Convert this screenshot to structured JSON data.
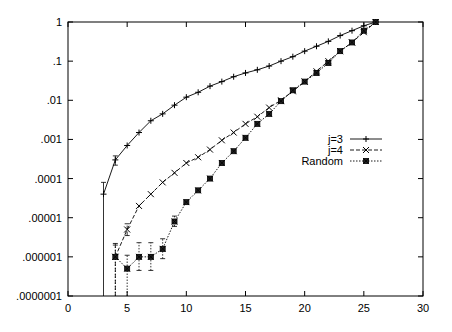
{
  "chart_data": {
    "type": "line",
    "title": "",
    "xlabel": "",
    "ylabel": "",
    "xscale": "linear",
    "yscale": "log",
    "xlim": [
      0,
      30
    ],
    "ylim": [
      1e-07,
      1
    ],
    "grid": false,
    "legend_position": "right-middle inside",
    "x_ticks": [
      0,
      5,
      10,
      15,
      20,
      25,
      30
    ],
    "x_tick_labels": [
      "0",
      "5",
      "10",
      "15",
      "20",
      "25",
      "30"
    ],
    "y_ticks": [
      1,
      0.1,
      0.01,
      0.001,
      0.0001,
      1e-05,
      1e-06,
      1e-07
    ],
    "y_tick_labels": [
      "1",
      ".1",
      ".01",
      ".001",
      ".0001",
      ".00001",
      ".000001",
      ".0000001"
    ],
    "series": [
      {
        "name": "j=3",
        "style": "solid",
        "marker": "plus",
        "x": [
          3,
          4,
          5,
          6,
          7,
          8,
          9,
          10,
          11,
          12,
          13,
          14,
          15,
          16,
          17,
          18,
          19,
          20,
          21,
          22,
          23,
          24,
          25,
          26
        ],
        "values": [
          4e-05,
          0.0003,
          0.0007,
          0.0015,
          0.003,
          0.0045,
          0.0075,
          0.012,
          0.016,
          0.023,
          0.03,
          0.04,
          0.05,
          0.06,
          0.075,
          0.1,
          0.13,
          0.18,
          0.24,
          0.32,
          0.45,
          0.6,
          0.8,
          1
        ],
        "error_low": [
          1e-07,
          0.00022,
          null,
          null,
          null,
          null,
          null,
          null,
          null,
          null,
          null,
          null,
          null,
          null,
          null,
          null,
          null,
          null,
          null,
          null,
          null,
          null,
          null,
          null
        ],
        "error_high": [
          8e-05,
          0.00038,
          null,
          null,
          null,
          null,
          null,
          null,
          null,
          null,
          null,
          null,
          null,
          null,
          null,
          null,
          null,
          null,
          null,
          null,
          null,
          null,
          null,
          null
        ]
      },
      {
        "name": "j=4",
        "style": "dashed",
        "marker": "cross",
        "x": [
          4,
          5,
          6,
          7,
          8,
          9,
          10,
          11,
          12,
          13,
          14,
          15,
          16,
          17,
          18,
          19,
          20,
          21,
          22,
          23,
          24,
          25,
          26
        ],
        "values": [
          1e-06,
          5e-06,
          2e-05,
          4e-05,
          8e-05,
          0.00014,
          0.00025,
          0.00035,
          0.00055,
          0.00095,
          0.0015,
          0.0025,
          0.0038,
          0.0065,
          0.01,
          0.017,
          0.03,
          0.055,
          0.1,
          0.18,
          0.3,
          0.55,
          1
        ],
        "error_low": [
          1e-07,
          3.5e-06,
          null,
          null,
          null,
          null,
          null,
          null,
          null,
          null,
          null,
          null,
          null,
          null,
          null,
          null,
          null,
          null,
          null,
          null,
          null,
          null,
          null
        ],
        "error_high": [
          2e-06,
          7e-06,
          null,
          null,
          null,
          null,
          null,
          null,
          null,
          null,
          null,
          null,
          null,
          null,
          null,
          null,
          null,
          null,
          null,
          null,
          null,
          null,
          null
        ]
      },
      {
        "name": "Random",
        "style": "dotted",
        "marker": "boxed-star",
        "x": [
          4,
          5,
          6,
          7,
          8,
          9,
          10,
          11,
          12,
          13,
          14,
          15,
          16,
          17,
          18,
          19,
          20,
          21,
          22,
          23,
          24,
          25,
          26
        ],
        "values": [
          1e-06,
          5e-07,
          1e-06,
          1e-06,
          1.6e-06,
          8e-06,
          2.5e-05,
          5e-05,
          0.0001,
          0.00025,
          0.0005,
          0.0011,
          0.0025,
          0.0045,
          0.0095,
          0.018,
          0.03,
          0.05,
          0.09,
          0.18,
          0.3,
          0.6,
          1
        ],
        "error_low": [
          1e-07,
          1e-07,
          4.5e-07,
          4.5e-07,
          9e-07,
          6e-06,
          null,
          null,
          null,
          null,
          null,
          null,
          null,
          null,
          null,
          null,
          null,
          null,
          null,
          null,
          null,
          null,
          null
        ],
        "error_high": [
          2.2e-06,
          1.1e-06,
          2.3e-06,
          2.3e-06,
          2.9e-06,
          1.1e-05,
          null,
          null,
          null,
          null,
          null,
          null,
          null,
          null,
          null,
          null,
          null,
          null,
          null,
          null,
          null,
          null,
          null
        ]
      }
    ]
  },
  "legend": {
    "items": [
      {
        "label": "j=3"
      },
      {
        "label": "j=4"
      },
      {
        "label": "Random"
      }
    ]
  }
}
